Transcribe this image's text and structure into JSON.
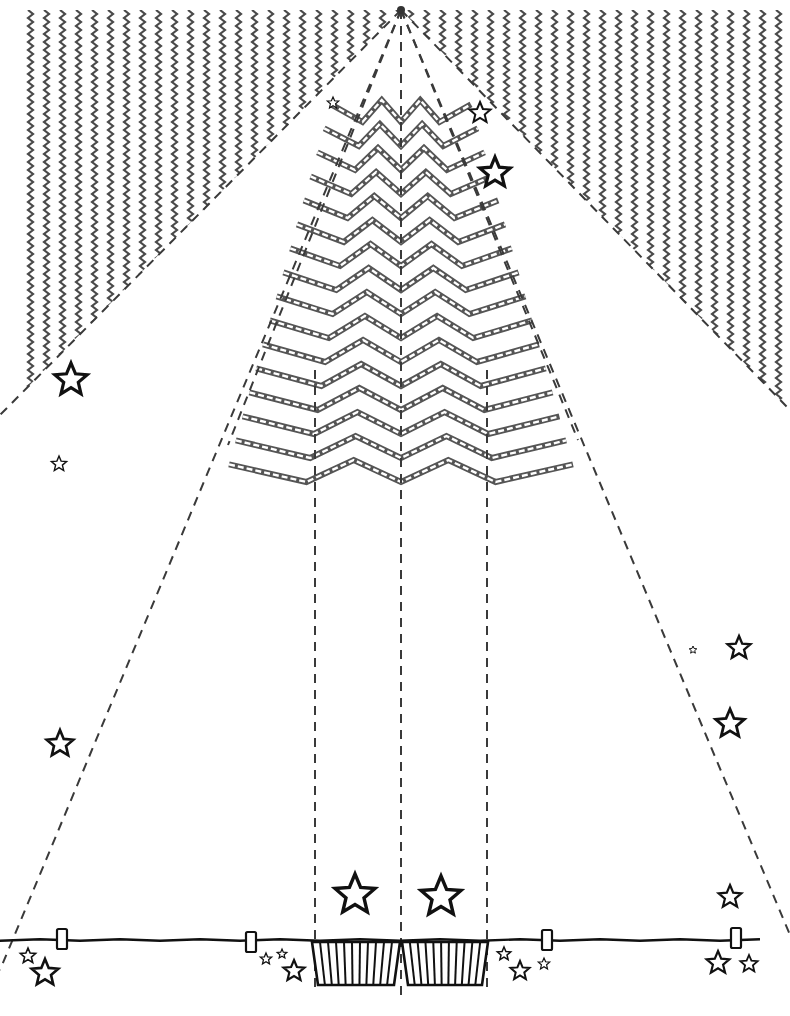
{
  "colors": {
    "background": "#ffffff",
    "pattern": "#4a4a4a",
    "ink": "#111111",
    "fold_line": "#3a3a3a"
  },
  "canvas": {
    "width": 790,
    "height": 1016
  },
  "apex": {
    "x": 401,
    "y": 10
  },
  "background_panels": [
    {
      "name": "left-zigzag-panel",
      "polygon": [
        [
          0,
          10
        ],
        [
          401,
          10
        ],
        [
          0,
          415
        ]
      ]
    },
    {
      "name": "right-zigzag-panel",
      "polygon": [
        [
          401,
          10
        ],
        [
          790,
          10
        ],
        [
          790,
          410
        ]
      ]
    }
  ],
  "fold_lines": [
    {
      "name": "outer-left-fold",
      "from": [
        401,
        10
      ],
      "to": [
        0,
        970
      ]
    },
    {
      "name": "outer-right-fold",
      "from": [
        401,
        10
      ],
      "to": [
        790,
        935
      ]
    },
    {
      "name": "inner-left-fold",
      "from": [
        401,
        10
      ],
      "to": [
        0,
        415
      ]
    },
    {
      "name": "inner-right-fold",
      "from": [
        401,
        10
      ],
      "to": [
        790,
        410
      ]
    },
    {
      "name": "tree-left-edge-fold",
      "from": [
        401,
        10
      ],
      "to": [
        228,
        445
      ]
    },
    {
      "name": "tree-right-edge-fold",
      "from": [
        401,
        10
      ],
      "to": [
        578,
        440
      ]
    },
    {
      "name": "center-fold",
      "from": [
        401,
        10
      ],
      "to": [
        401,
        1000
      ]
    },
    {
      "name": "trunk-left-fold",
      "from": [
        315,
        370
      ],
      "to": [
        315,
        990
      ]
    },
    {
      "name": "trunk-right-fold",
      "from": [
        487,
        370
      ],
      "to": [
        487,
        990
      ]
    }
  ],
  "tree": {
    "center_x": 401,
    "top_y": 100,
    "rows": 16,
    "row_spacing": 24,
    "top_half_width": 70,
    "bottom_half_width": 172,
    "zig_amplitude": 22
  },
  "garland": {
    "y": 940,
    "x_start": 0,
    "x_end": 790,
    "clips": [
      {
        "x": 62,
        "y": 932
      },
      {
        "x": 251,
        "y": 935
      },
      {
        "x": 547,
        "y": 933
      },
      {
        "x": 736,
        "y": 931
      }
    ]
  },
  "pots": [
    {
      "name": "left-pot",
      "x1": 312,
      "x2": 400,
      "top": 942,
      "bottom": 985,
      "stripes": 10
    },
    {
      "name": "right-pot",
      "x1": 402,
      "x2": 488,
      "top": 942,
      "bottom": 985,
      "stripes": 10
    }
  ],
  "stars": [
    {
      "x": 333,
      "y": 103,
      "r": 6,
      "w": 1.2
    },
    {
      "x": 480,
      "y": 113,
      "r": 11,
      "w": 2
    },
    {
      "x": 495,
      "y": 173,
      "r": 16,
      "w": 3.2
    },
    {
      "x": 71,
      "y": 380,
      "r": 17,
      "w": 3.2
    },
    {
      "x": 59,
      "y": 464,
      "r": 8,
      "w": 1.4
    },
    {
      "x": 693,
      "y": 650,
      "r": 4,
      "w": 1
    },
    {
      "x": 739,
      "y": 648,
      "r": 12,
      "w": 2.4
    },
    {
      "x": 730,
      "y": 724,
      "r": 15,
      "w": 2.8
    },
    {
      "x": 60,
      "y": 744,
      "r": 14,
      "w": 2.6
    },
    {
      "x": 355,
      "y": 895,
      "r": 21,
      "w": 3.4
    },
    {
      "x": 441,
      "y": 897,
      "r": 21,
      "w": 3.4
    },
    {
      "x": 730,
      "y": 897,
      "r": 12,
      "w": 2.2
    },
    {
      "x": 28,
      "y": 956,
      "r": 8,
      "w": 1.6
    },
    {
      "x": 45,
      "y": 973,
      "r": 14,
      "w": 2.6
    },
    {
      "x": 266,
      "y": 959,
      "r": 6,
      "w": 1.3
    },
    {
      "x": 282,
      "y": 954,
      "r": 5,
      "w": 1.2
    },
    {
      "x": 294,
      "y": 971,
      "r": 11,
      "w": 2.2
    },
    {
      "x": 504,
      "y": 954,
      "r": 7,
      "w": 1.5
    },
    {
      "x": 520,
      "y": 971,
      "r": 10,
      "w": 2
    },
    {
      "x": 544,
      "y": 964,
      "r": 6,
      "w": 1.2
    },
    {
      "x": 718,
      "y": 963,
      "r": 12,
      "w": 2.2
    },
    {
      "x": 749,
      "y": 964,
      "r": 9,
      "w": 1.8
    }
  ]
}
